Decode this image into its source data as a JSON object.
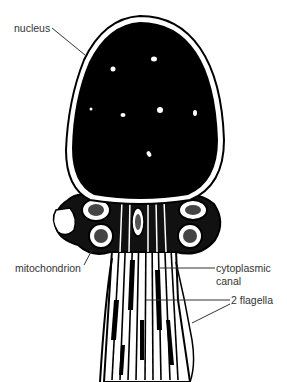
{
  "figure": {
    "labels": {
      "nucleus": "nucleus",
      "mitochondrion": "mitochondrion",
      "cytoplasmic_canal_line1": "cytoplasmic",
      "cytoplasmic_canal_line2": "canal",
      "flagella": "2 flagella"
    },
    "colors": {
      "ink": "#000000",
      "paper": "#ffffff",
      "label_text": "#333333"
    }
  }
}
